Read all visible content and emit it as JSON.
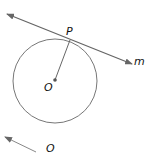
{
  "diagram": {
    "title": "",
    "circle": {
      "center_label": "O",
      "cx": 55,
      "cy": 81,
      "r": 42
    },
    "tangent_point": {
      "label": "P",
      "x": 70,
      "y": 40
    },
    "tangent_line": {
      "label": "m",
      "x1": 7,
      "y1": 14,
      "x2": 132,
      "y2": 64
    },
    "radius_segment": {
      "from": "O",
      "to": "P"
    },
    "partial_figure": {
      "label": "O",
      "arrow_from_x": 36,
      "arrow_from_y": 152,
      "arrow_to_x": 5,
      "arrow_to_y": 137
    },
    "colors": {
      "line": "#666666",
      "circle": "#777777",
      "label": "#111111"
    }
  }
}
